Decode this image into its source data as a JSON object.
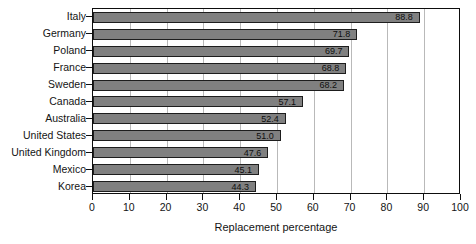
{
  "chart_data": {
    "type": "bar",
    "orientation": "horizontal",
    "title": "",
    "xlabel": "Replacement percentage",
    "ylabel": "",
    "xlim": [
      0,
      100
    ],
    "xticks": [
      0,
      10,
      20,
      30,
      40,
      50,
      60,
      70,
      80,
      90,
      100
    ],
    "grid": true,
    "grid_axis": "x",
    "legend": false,
    "categories": [
      "Italy",
      "Germany",
      "Poland",
      "France",
      "Sweden",
      "Canada",
      "Australia",
      "United States",
      "United Kingdom",
      "Mexico",
      "Korea"
    ],
    "values": [
      88.8,
      71.8,
      69.7,
      68.8,
      68.2,
      57.1,
      52.4,
      51.0,
      47.6,
      45.1,
      44.3
    ],
    "value_labels": [
      "88.8",
      "71.8",
      "69.7",
      "68.8",
      "68.2",
      "57.1",
      "52.4",
      "51.0",
      "47.6",
      "45.1",
      "44.3"
    ],
    "bar_color": "#808080",
    "bar_border_color": "#1d1d1d",
    "grid_color": "#b9b9b9",
    "axis_color": "#0d0d0d"
  }
}
